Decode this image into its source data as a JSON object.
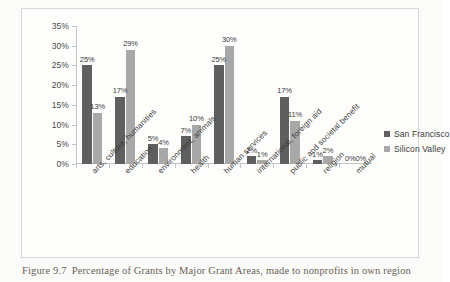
{
  "caption": {
    "figure_number": "Figure 9.7",
    "text": "Percentage of Grants by Major Grant Areas, made to nonprofits in own region"
  },
  "legend": {
    "position": "right",
    "items": [
      {
        "label": "San Francisco",
        "color": "#5f5f5f"
      },
      {
        "label": "Silicon Valley",
        "color": "#a8a8a8"
      }
    ]
  },
  "chart_data": {
    "type": "bar",
    "title": "",
    "xlabel": "",
    "ylabel": "",
    "ylim": [
      0,
      35
    ],
    "grid": false,
    "legend_position": "right",
    "y_ticks": [
      "0%",
      "5%",
      "10%",
      "15%",
      "20%",
      "25%",
      "30%",
      "35%"
    ],
    "y_tick_values": [
      0,
      5,
      10,
      15,
      20,
      25,
      30,
      35
    ],
    "categories": [
      "arts, culture, humanities",
      "education",
      "environment, animals",
      "health",
      "human services",
      "international, foreign aid",
      "public and societal benefit",
      "religion",
      "mutual"
    ],
    "series": [
      {
        "name": "San Francisco",
        "color": "#5f5f5f",
        "values": [
          25,
          17,
          5,
          7,
          25,
          2,
          17,
          1,
          0
        ],
        "labels": [
          "25%",
          "17%",
          "5%",
          "7%",
          "25%",
          "2%",
          "17%",
          "1%",
          "0%"
        ]
      },
      {
        "name": "Silicon Valley",
        "color": "#a8a8a8",
        "values": [
          13,
          29,
          4,
          10,
          30,
          1,
          11,
          2,
          0
        ],
        "labels": [
          "13%",
          "29%",
          "4%",
          "10%",
          "30%",
          "1%",
          "11%",
          "2%",
          "0%"
        ]
      }
    ]
  }
}
